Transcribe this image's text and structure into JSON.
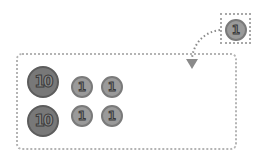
{
  "diagram": {
    "source": {
      "coin": {
        "label": "1",
        "value": 1
      }
    },
    "target": {
      "rows": [
        [
          {
            "label": "10",
            "value": 10
          },
          {
            "label": "1",
            "value": 1
          },
          {
            "label": "1",
            "value": 1
          }
        ],
        [
          {
            "label": "10",
            "value": 10
          },
          {
            "label": "1",
            "value": 1
          },
          {
            "label": "1",
            "value": 1
          }
        ]
      ]
    },
    "colors": {
      "coin_big": "#787878",
      "coin_small": "#9a9a9a",
      "dotted_border": "#b4b4b4",
      "arrow": "#8a8a8a"
    }
  }
}
